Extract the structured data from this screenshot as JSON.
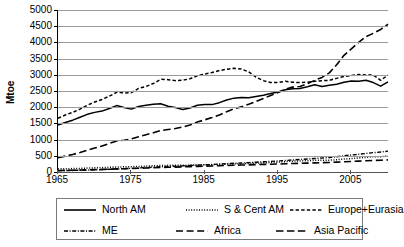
{
  "chart_data": {
    "type": "line",
    "title": "",
    "subtitle": "",
    "xlabel": "",
    "ylabel": "Mtoe",
    "xlim": [
      1965,
      2010
    ],
    "ylim": [
      0,
      5000
    ],
    "grid": true,
    "legend_position": "bottom",
    "yticks": [
      0,
      500,
      1000,
      1500,
      2000,
      2500,
      3000,
      3500,
      4000,
      4500,
      5000
    ],
    "ytick_labels": [
      "0",
      "500",
      "1000",
      "1500",
      "2000",
      "2500",
      "3000",
      "3500",
      "4000",
      "4500",
      "5000"
    ],
    "xticks": [
      1965,
      1975,
      1985,
      1995,
      2005
    ],
    "xtick_labels": [
      "1965",
      "1975",
      "1985",
      "1995",
      "2005"
    ],
    "x": [
      1965,
      1966,
      1967,
      1968,
      1969,
      1970,
      1971,
      1972,
      1973,
      1974,
      1975,
      1976,
      1977,
      1978,
      1979,
      1980,
      1981,
      1982,
      1983,
      1984,
      1985,
      1986,
      1987,
      1988,
      1989,
      1990,
      1991,
      1992,
      1993,
      1994,
      1995,
      1996,
      1997,
      1998,
      1999,
      2000,
      2001,
      2002,
      2003,
      2004,
      2005,
      2006,
      2007,
      2008,
      2009,
      2010
    ],
    "series": [
      {
        "name": "North AM",
        "style": "solid",
        "color": "#000000",
        "values": [
          1450,
          1530,
          1600,
          1690,
          1780,
          1840,
          1880,
          1960,
          2050,
          1990,
          1940,
          2020,
          2060,
          2090,
          2105,
          2030,
          1990,
          1930,
          1975,
          2060,
          2080,
          2080,
          2140,
          2220,
          2280,
          2300,
          2290,
          2330,
          2370,
          2420,
          2470,
          2540,
          2570,
          2580,
          2630,
          2690,
          2640,
          2680,
          2710,
          2770,
          2810,
          2800,
          2830,
          2760,
          2650,
          2780
        ]
      },
      {
        "name": "S & Cent AM",
        "style": "dotted",
        "color": "#000000",
        "values": [
          95,
          100,
          105,
          112,
          120,
          128,
          136,
          145,
          155,
          160,
          165,
          172,
          182,
          192,
          200,
          205,
          208,
          210,
          212,
          218,
          222,
          226,
          234,
          242,
          250,
          255,
          262,
          272,
          282,
          292,
          305,
          320,
          335,
          342,
          348,
          360,
          362,
          365,
          378,
          398,
          415,
          432,
          452,
          470,
          470,
          500
        ]
      },
      {
        "name": "Europe+Eurasia",
        "style": "dashed",
        "color": "#000000",
        "values": [
          1660,
          1760,
          1840,
          1940,
          2060,
          2160,
          2240,
          2340,
          2460,
          2440,
          2450,
          2580,
          2640,
          2730,
          2860,
          2850,
          2820,
          2830,
          2880,
          2970,
          3020,
          3070,
          3130,
          3170,
          3200,
          3180,
          3090,
          2930,
          2820,
          2760,
          2760,
          2800,
          2770,
          2760,
          2770,
          2800,
          2820,
          2830,
          2890,
          2950,
          2980,
          3010,
          2990,
          2990,
          2830,
          2990
        ]
      },
      {
        "name": "ME",
        "style": "dashdot",
        "color": "#000000",
        "values": [
          40,
          44,
          48,
          54,
          60,
          66,
          74,
          84,
          94,
          102,
          112,
          126,
          140,
          152,
          162,
          170,
          178,
          188,
          200,
          212,
          222,
          232,
          245,
          258,
          270,
          278,
          288,
          302,
          316,
          328,
          340,
          356,
          372,
          386,
          400,
          418,
          432,
          446,
          470,
          500,
          525,
          548,
          572,
          598,
          615,
          645
        ]
      },
      {
        "name": "Africa",
        "style": "longdash",
        "color": "#000000",
        "values": [
          48,
          52,
          56,
          62,
          68,
          74,
          80,
          88,
          96,
          102,
          108,
          116,
          124,
          132,
          140,
          146,
          152,
          158,
          166,
          174,
          180,
          186,
          194,
          202,
          210,
          215,
          220,
          228,
          234,
          240,
          246,
          254,
          262,
          268,
          274,
          282,
          288,
          294,
          304,
          316,
          326,
          336,
          346,
          356,
          362,
          375
        ]
      },
      {
        "name": "Asia Pacific",
        "style": "longdash2",
        "color": "#000000",
        "values": [
          440,
          490,
          540,
          600,
          670,
          740,
          800,
          880,
          960,
          980,
          1020,
          1090,
          1150,
          1210,
          1280,
          1310,
          1340,
          1390,
          1450,
          1540,
          1610,
          1680,
          1760,
          1860,
          1950,
          2010,
          2090,
          2180,
          2270,
          2360,
          2450,
          2560,
          2620,
          2640,
          2720,
          2830,
          2920,
          3060,
          3310,
          3600,
          3800,
          4000,
          4180,
          4280,
          4400,
          4560
        ]
      }
    ]
  },
  "axis": {
    "ylabel": "Mtoe"
  },
  "legend": {
    "rows": [
      [
        {
          "label": "North AM",
          "style": "solid"
        },
        {
          "label": "S & Cent AM",
          "style": "dotted"
        },
        {
          "label": "Europe+Eurasia",
          "style": "dashed"
        }
      ],
      [
        {
          "label": "ME",
          "style": "dashdot"
        },
        {
          "label": "Africa",
          "style": "longdash"
        },
        {
          "label": "Asia Pacific",
          "style": "longdash2"
        }
      ]
    ]
  }
}
